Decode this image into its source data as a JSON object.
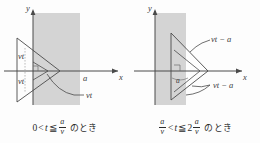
{
  "figure": {
    "panels": [
      {
        "id": "left",
        "axis_y_label": "y",
        "axis_x_label": "x",
        "labels": {
          "vt_upper": "vt",
          "vt_lower": "vt",
          "a_on_axis": "a",
          "vt_leader": "vt"
        },
        "caption": {
          "lhs": "0",
          "rel1": "<",
          "var": "t",
          "rel2": "≦",
          "frac1_num": "a",
          "frac1_den": "v",
          "suffix": "のとき"
        }
      },
      {
        "id": "right",
        "axis_y_label": "y",
        "axis_x_label": "x",
        "labels": {
          "vt_minus_a_upper": "vt − a",
          "vt_minus_a_lower": "vt − a",
          "a_near_origin": "a"
        },
        "caption": {
          "frac1_num": "a",
          "frac1_den": "v",
          "rel1": "<",
          "var": "t",
          "rel2": "≦",
          "coef": "2",
          "frac2_num": "a",
          "frac2_den": "v",
          "suffix": "のとき"
        }
      }
    ],
    "colors": {
      "band": "#d4d4d4",
      "stroke": "#4a4a4a",
      "text": "#2b2b2b",
      "background": "#fdfdfd"
    }
  }
}
